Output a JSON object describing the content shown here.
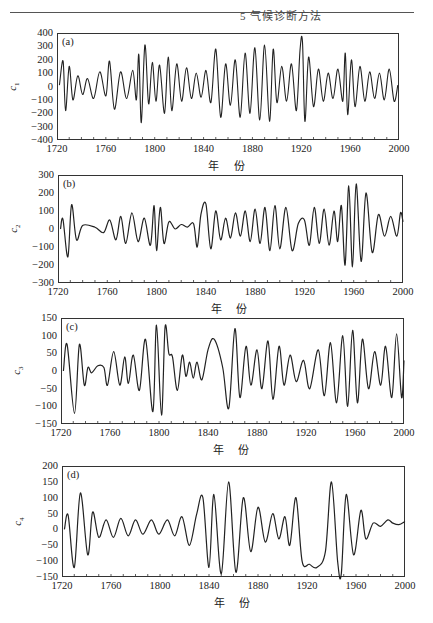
{
  "header": {
    "running_head": "5 气候诊断方法"
  },
  "chart_data": [
    {
      "type": "line",
      "panel_label": "(a)",
      "ylabel": "c1",
      "xlabel": "年 份",
      "xlim": [
        1720,
        2000
      ],
      "ylim": [
        -400,
        400
      ],
      "xticks": [
        1720,
        1760,
        1800,
        1840,
        1880,
        1920,
        1960,
        2000
      ],
      "yticks": [
        400,
        300,
        200,
        100,
        0,
        -100,
        -200,
        -300,
        -400
      ],
      "grid": false,
      "description": "IMF c1: high-frequency oscillation, ~3-5 yr period, amplitude mostly within ±200, peaks up to ~320 near 1790 and ~330 near 1920, troughs to ~-270 near 1787, 1897, 1923",
      "x": [
        1722,
        1725,
        1727,
        1730,
        1733,
        1737,
        1741,
        1745,
        1750,
        1755,
        1760,
        1763,
        1767,
        1772,
        1777,
        1782,
        1785,
        1787,
        1789,
        1792,
        1795,
        1798,
        1801,
        1804,
        1808,
        1811,
        1814,
        1818,
        1822,
        1826,
        1830,
        1834,
        1838,
        1842,
        1846,
        1850,
        1854,
        1858,
        1862,
        1866,
        1870,
        1874,
        1878,
        1882,
        1886,
        1890,
        1894,
        1897,
        1900,
        1904,
        1908,
        1912,
        1916,
        1919,
        1921,
        1923,
        1926,
        1930,
        1934,
        1938,
        1942,
        1946,
        1950,
        1954,
        1956,
        1958,
        1961,
        1964,
        1968,
        1972,
        1976,
        1980,
        1984,
        1988,
        1992,
        1996,
        1999
      ],
      "values": [
        10,
        190,
        -180,
        150,
        -100,
        80,
        -60,
        60,
        -90,
        110,
        -70,
        190,
        -170,
        110,
        -90,
        120,
        -100,
        240,
        -270,
        310,
        -130,
        180,
        -110,
        160,
        -200,
        220,
        -180,
        170,
        -110,
        140,
        -90,
        100,
        -80,
        120,
        -120,
        280,
        -230,
        170,
        -140,
        200,
        -230,
        250,
        -200,
        290,
        -250,
        310,
        -260,
        280,
        -120,
        150,
        -110,
        170,
        -180,
        280,
        330,
        -260,
        220,
        -150,
        130,
        -110,
        100,
        -90,
        130,
        -110,
        250,
        -210,
        200,
        -150,
        150,
        -110,
        110,
        -90,
        100,
        -100,
        130,
        -110,
        10
      ]
    },
    {
      "type": "line",
      "panel_label": "(b)",
      "ylabel": "c2",
      "xlabel": "年 份",
      "xlim": [
        1720,
        2000
      ],
      "ylim": [
        -300,
        300
      ],
      "xticks": [
        1720,
        1760,
        1800,
        1840,
        1880,
        1920,
        1960,
        2000
      ],
      "yticks": [
        300,
        200,
        100,
        0,
        -100,
        -200,
        -300
      ],
      "grid": false,
      "description": "IMF c2: ~8-10 yr oscillation, large excursions near 1730 (-150/+135), calm 1740-1760, growing amplitude to ±250 around 1950-1965",
      "x": [
        1722,
        1724,
        1728,
        1731,
        1735,
        1740,
        1750,
        1757,
        1762,
        1767,
        1771,
        1775,
        1780,
        1785,
        1790,
        1795,
        1798,
        1800,
        1803,
        1806,
        1810,
        1815,
        1820,
        1825,
        1830,
        1833,
        1836,
        1840,
        1844,
        1848,
        1852,
        1856,
        1860,
        1864,
        1868,
        1872,
        1876,
        1880,
        1884,
        1888,
        1892,
        1896,
        1900,
        1905,
        1910,
        1915,
        1920,
        1924,
        1928,
        1932,
        1936,
        1940,
        1944,
        1947,
        1950,
        1953,
        1956,
        1959,
        1962,
        1966,
        1970,
        1975,
        1980,
        1985,
        1990,
        1995,
        1998,
        2000
      ],
      "values": [
        0,
        55,
        -155,
        135,
        -60,
        20,
        10,
        -20,
        50,
        -60,
        70,
        -80,
        90,
        -70,
        60,
        -90,
        130,
        -120,
        120,
        -80,
        40,
        0,
        25,
        10,
        30,
        -100,
        80,
        140,
        -110,
        100,
        -60,
        60,
        -50,
        90,
        -40,
        100,
        -70,
        110,
        -80,
        120,
        -120,
        130,
        -110,
        120,
        -120,
        30,
        50,
        -90,
        120,
        -80,
        110,
        -90,
        100,
        -70,
        130,
        -200,
        240,
        -210,
        250,
        -180,
        200,
        -130,
        80,
        -40,
        70,
        -40,
        90,
        40
      ]
    },
    {
      "type": "line",
      "panel_label": "(c)",
      "ylabel": "c3",
      "xlabel": "年 份",
      "xlim": [
        1720,
        2000
      ],
      "ylim": [
        -150,
        150
      ],
      "xticks": [
        1720,
        1760,
        1800,
        1840,
        1880,
        1920,
        1960,
        2000
      ],
      "yticks": [
        150,
        100,
        50,
        0,
        -50,
        -100,
        -150
      ],
      "grid": false,
      "description": "IMF c3: ~15 yr oscillation, extremes near 1800 (+130/-125), 1857 (-105), 1862 (+115), 1950-1958 (±110)",
      "x": [
        1722,
        1725,
        1731,
        1735,
        1739,
        1742,
        1745,
        1750,
        1755,
        1758,
        1763,
        1768,
        1772,
        1775,
        1779,
        1784,
        1789,
        1795,
        1798,
        1802,
        1805,
        1808,
        1811,
        1815,
        1819,
        1822,
        1825,
        1828,
        1831,
        1835,
        1840,
        1845,
        1852,
        1857,
        1862,
        1866,
        1871,
        1875,
        1880,
        1884,
        1889,
        1893,
        1898,
        1902,
        1907,
        1912,
        1918,
        1923,
        1930,
        1935,
        1940,
        1945,
        1950,
        1954,
        1958,
        1962,
        1966,
        1971,
        1976,
        1981,
        1985,
        1990,
        1994,
        1998,
        2000
      ],
      "values": [
        0,
        75,
        -120,
        75,
        -40,
        10,
        -5,
        15,
        10,
        -40,
        55,
        -40,
        40,
        -35,
        45,
        -55,
        90,
        -115,
        130,
        -125,
        125,
        50,
        40,
        -55,
        45,
        -15,
        25,
        -20,
        25,
        -25,
        60,
        90,
        10,
        -105,
        120,
        -75,
        70,
        -40,
        60,
        -50,
        85,
        -80,
        70,
        -40,
        45,
        -30,
        30,
        -50,
        60,
        -70,
        80,
        -90,
        100,
        -100,
        115,
        -90,
        90,
        -50,
        55,
        -40,
        70,
        -75,
        105,
        -75,
        30
      ]
    },
    {
      "type": "line",
      "panel_label": "(d)",
      "ylabel": "c4",
      "xlabel": "年 份",
      "xlim": [
        1720,
        2000
      ],
      "ylim": [
        -150,
        200
      ],
      "xticks": [
        1720,
        1760,
        1800,
        1840,
        1880,
        1920,
        1960,
        2000
      ],
      "yticks": [
        200,
        150,
        100,
        50,
        0,
        -50,
        -100,
        -150
      ],
      "grid": false,
      "description": "IMF c4: ~20-25 yr oscillation, smooth; early swing -120/+115 around 1730-1740, quiet ±30 from 1760-1840, large oscillations ±140 from 1850-1970",
      "x": [
        1722,
        1725,
        1730,
        1735,
        1741,
        1745,
        1750,
        1756,
        1762,
        1768,
        1774,
        1780,
        1786,
        1793,
        1799,
        1806,
        1812,
        1818,
        1824,
        1830,
        1835,
        1840,
        1844,
        1850,
        1856,
        1862,
        1868,
        1874,
        1880,
        1886,
        1892,
        1897,
        1902,
        1906,
        1911,
        1916,
        1922,
        1928,
        1935,
        1940,
        1945,
        1948,
        1952,
        1958,
        1964,
        1968,
        1974,
        1980,
        1986,
        1990,
        1995,
        2000
      ],
      "values": [
        0,
        45,
        -120,
        115,
        -80,
        55,
        -25,
        30,
        -25,
        35,
        -20,
        30,
        -15,
        30,
        -15,
        30,
        -20,
        40,
        -50,
        50,
        100,
        -120,
        110,
        -140,
        150,
        -135,
        100,
        -70,
        70,
        -40,
        50,
        -30,
        40,
        -50,
        100,
        -100,
        -110,
        -120,
        -70,
        150,
        -100,
        -140,
        110,
        -80,
        60,
        -30,
        20,
        10,
        30,
        20,
        15,
        25
      ]
    }
  ]
}
